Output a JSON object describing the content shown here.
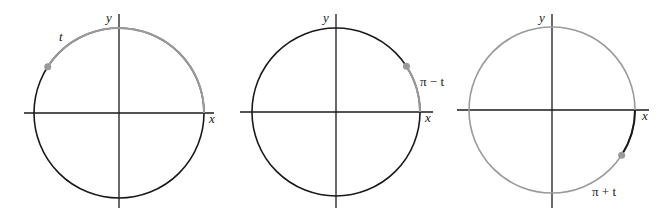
{
  "colors": {
    "ink": "#1a1a1a",
    "highlight": "#9a9a9a"
  },
  "panels": [
    {
      "id": "panel-t",
      "axis_x_label": "x",
      "axis_y_label": "y",
      "arc_label": "t",
      "base_color": "ink",
      "arc_color": "highlight",
      "arc_from_deg": 0,
      "arc_to_deg": 147,
      "point_deg": 147
    },
    {
      "id": "panel-pi-minus-t",
      "axis_x_label": "x",
      "axis_y_label": "y",
      "arc_label": "π − t",
      "base_color": "ink",
      "arc_color": "highlight",
      "arc_from_deg": 0,
      "arc_to_deg": 33,
      "point_deg": 33
    },
    {
      "id": "panel-pi-plus-t",
      "axis_x_label": "x",
      "axis_y_label": "y",
      "arc_label": "π + t",
      "base_color": "highlight",
      "arc_color": "ink",
      "arc_from_deg": -33,
      "arc_to_deg": 0,
      "point_deg": -33
    }
  ]
}
